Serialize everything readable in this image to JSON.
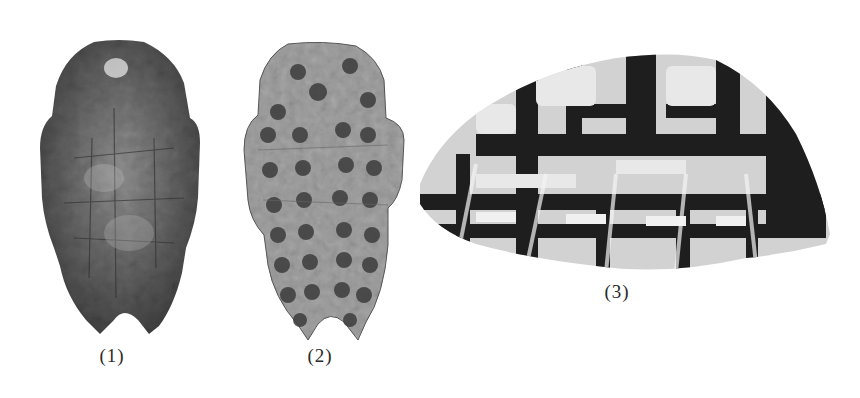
{
  "figures": [
    {
      "id": "1",
      "label": "(1)",
      "description": "Dark turtle plastron with fracture lines"
    },
    {
      "id": "2",
      "label": "(2)",
      "description": "Turtle plastron with rows of drilled/burnt pits"
    },
    {
      "id": "3",
      "label": "(3)",
      "description": "Patterned turtle carapace, side view"
    }
  ],
  "colors": {
    "background": "#ffffff",
    "shell1_base": "#4a4a4a",
    "shell2_base": "#8e8e8e",
    "shell3_dark": "#1e1e1e",
    "shell3_light": "#d8d8d8",
    "label_text": "#2a2a2a"
  }
}
